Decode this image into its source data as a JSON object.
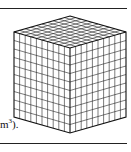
{
  "figure": {
    "caption_fragment": "m",
    "caption_superscript": "3",
    "caption_tail": ").",
    "grid_divisions": 10,
    "line_color": "#222222"
  }
}
